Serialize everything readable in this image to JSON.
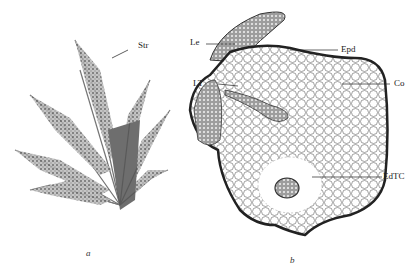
{
  "figure": {
    "panel_a": {
      "caption": "a",
      "subject": "moss-plant-habit",
      "labels": [
        {
          "text": "Str",
          "x": 138,
          "y": 46
        }
      ]
    },
    "panel_b": {
      "caption": "b",
      "subject": "stem-cross-section",
      "labels": [
        {
          "text": "Le",
          "x": 190,
          "y": 40
        },
        {
          "text": "Epd",
          "x": 341,
          "y": 46
        },
        {
          "text": "LT",
          "x": 193,
          "y": 81
        },
        {
          "text": "Co",
          "x": 394,
          "y": 81
        },
        {
          "text": "EdTC",
          "x": 383,
          "y": 174
        }
      ]
    }
  }
}
